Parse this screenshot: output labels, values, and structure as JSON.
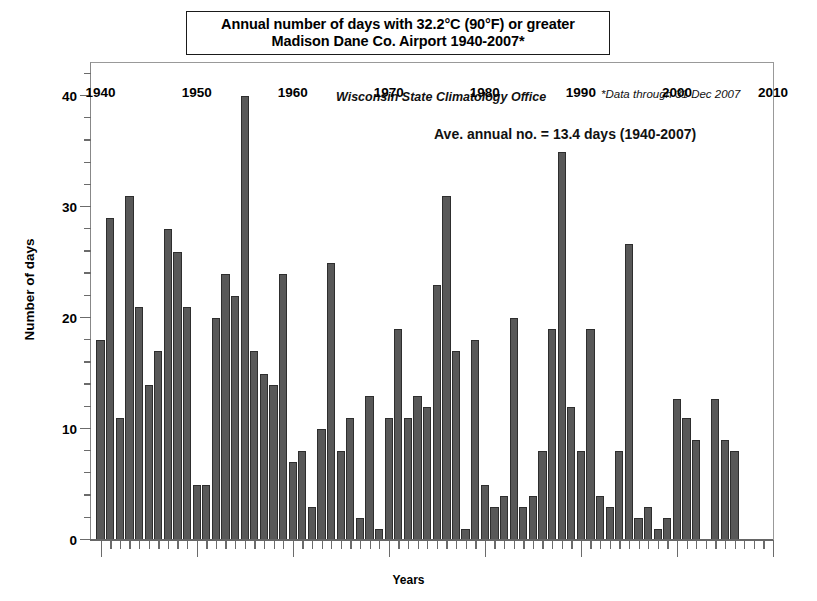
{
  "title": {
    "line1": "Annual number of days with 32.2°C (90°F) or greater",
    "line2": "Madison Dane Co. Airport  1940-2007*"
  },
  "annotations": {
    "office": "Wisconsin State Climatology Office",
    "footnote": "*Data through 31 Dec 2007",
    "average": "Ave. annual no. = 13.4 days (1940-2007)"
  },
  "axes": {
    "ylabel": "Number of days",
    "xlabel": "Years",
    "y_ticks": [
      0,
      10,
      20,
      30,
      40
    ],
    "x_ticks": [
      1940,
      1950,
      1960,
      1970,
      1980,
      1990,
      2000,
      2010
    ]
  },
  "colors": {
    "bar_fill": "#585858",
    "bar_edge": "#2e2e2e",
    "axis": "#6b6b6b",
    "text": "#000000",
    "background": "#ffffff"
  },
  "chart_data": {
    "type": "bar",
    "title": "Annual number of days with 32.2°C (90°F) or greater Madison Dane Co. Airport 1940-2007*",
    "xlabel": "Years",
    "ylabel": "Number of days",
    "xlim": [
      1939.0,
      2010.0
    ],
    "ylim": [
      0,
      43
    ],
    "grid": false,
    "legend": null,
    "series_name": "Annual days ≥ 32.2°C (90°F)",
    "mean_value": 13.4,
    "categories": [
      1940,
      1941,
      1942,
      1943,
      1944,
      1945,
      1946,
      1947,
      1948,
      1949,
      1950,
      1951,
      1952,
      1953,
      1954,
      1955,
      1956,
      1957,
      1958,
      1959,
      1960,
      1961,
      1962,
      1963,
      1964,
      1965,
      1966,
      1967,
      1968,
      1969,
      1970,
      1971,
      1972,
      1973,
      1974,
      1975,
      1976,
      1977,
      1978,
      1979,
      1980,
      1981,
      1982,
      1983,
      1984,
      1985,
      1986,
      1987,
      1988,
      1989,
      1990,
      1991,
      1992,
      1993,
      1994,
      1995,
      1996,
      1997,
      1998,
      1999,
      2000,
      2001,
      2002,
      2003,
      2004,
      2005,
      2006,
      2007
    ],
    "values": [
      18,
      29,
      11,
      31,
      21,
      14,
      17,
      28,
      26,
      21,
      5,
      5,
      20,
      24,
      22,
      40,
      17,
      15,
      14,
      24,
      7,
      8,
      3,
      10,
      25,
      8,
      11,
      2,
      13,
      1,
      11,
      19,
      11,
      13,
      12,
      23,
      31,
      17,
      1,
      18,
      5,
      3,
      4,
      20,
      3,
      4,
      8,
      19,
      35,
      12,
      8,
      19,
      4,
      3,
      8,
      26.7,
      2,
      3,
      1,
      2,
      12.7,
      11,
      9,
      0,
      12.7,
      9,
      8,
      0
    ]
  }
}
